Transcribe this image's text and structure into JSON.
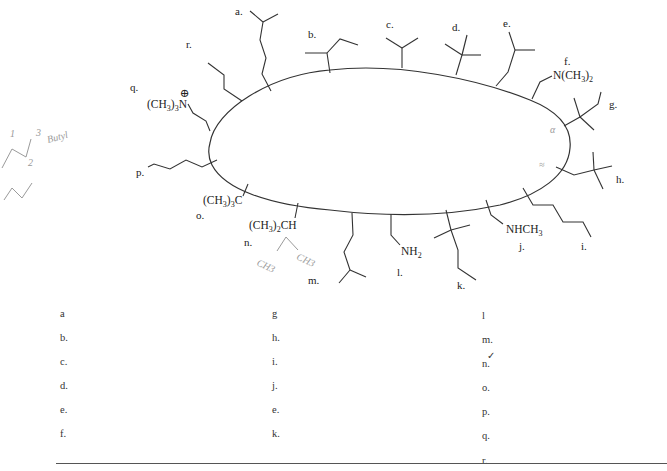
{
  "diagram": {
    "labels": {
      "a": "a.",
      "b": "b.",
      "c": "c.",
      "d": "d.",
      "e": "e.",
      "f": "f.",
      "g": "g.",
      "h": "h.",
      "i": "i.",
      "j": "j.",
      "k": "k.",
      "l": "l.",
      "m": "m.",
      "n": "n.",
      "o": "o.",
      "p": "p.",
      "q": "q.",
      "r": "r."
    },
    "groups": {
      "f": "N(CH3)2",
      "j": "NHCH3",
      "l": "NH2",
      "n": "(CH3)2CH",
      "o": "(CH3)3C",
      "q": "(CH3)3N",
      "q_charge": "⊕"
    },
    "handwriting": {
      "butyl_note": "Butyl",
      "num1": "1",
      "num2": "2",
      "num3": "3",
      "ch3_left": "CH3",
      "ch3_right": "CH3",
      "mark_g": "α",
      "mark_h": "≈"
    }
  },
  "answers": {
    "col1": [
      "a",
      "b.",
      "c.",
      "d.",
      "e.",
      "f."
    ],
    "col2": [
      "g",
      "h.",
      "i.",
      "j.",
      "e.",
      "k."
    ],
    "col3": [
      "l",
      "m.",
      "n.",
      "o.",
      "p.",
      "q.",
      "r."
    ],
    "check_mark": "✓"
  }
}
